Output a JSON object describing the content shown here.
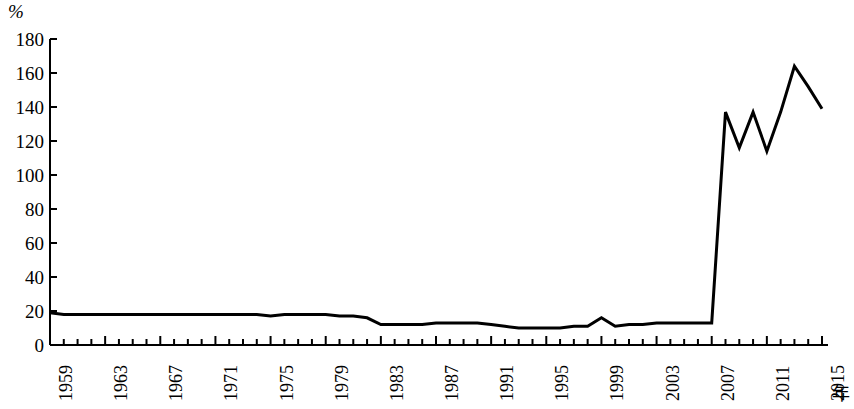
{
  "chart_data": {
    "type": "line",
    "title": "",
    "subtitle": "",
    "xlabel": "年",
    "ylabel": "%",
    "ylim": [
      0,
      180
    ],
    "xlim": [
      1959,
      2015
    ],
    "grid": false,
    "legend": null,
    "y_ticks": [
      0,
      20,
      40,
      60,
      80,
      100,
      120,
      140,
      160,
      180
    ],
    "y_tick_labels": [
      "0",
      "20",
      "40",
      "60",
      "80",
      "100",
      "120",
      "140",
      "160",
      "180"
    ],
    "x_tick_labels": [
      "1959",
      "1963",
      "1967",
      "1971",
      "1975",
      "1979",
      "1983",
      "1987",
      "1991",
      "1995",
      "1999",
      "2003",
      "2007",
      "2011",
      "2015"
    ],
    "x_tick_step": 4,
    "x_minor_tick_step": 1,
    "line_color": "#000000",
    "line_width": 3,
    "series": [
      {
        "name": "",
        "x": [
          1959,
          1960,
          1961,
          1962,
          1963,
          1964,
          1965,
          1966,
          1967,
          1968,
          1969,
          1970,
          1971,
          1972,
          1973,
          1974,
          1975,
          1976,
          1977,
          1978,
          1979,
          1980,
          1981,
          1982,
          1983,
          1984,
          1985,
          1986,
          1987,
          1988,
          1989,
          1990,
          1991,
          1992,
          1993,
          1994,
          1995,
          1996,
          1997,
          1998,
          1999,
          2000,
          2001,
          2002,
          2003,
          2004,
          2005,
          2006,
          2007,
          2008,
          2009,
          2010,
          2011,
          2012,
          2013,
          2014,
          2015
        ],
        "values": [
          19,
          18,
          18,
          18,
          18,
          18,
          18,
          18,
          18,
          18,
          18,
          18,
          18,
          18,
          18,
          18,
          17,
          18,
          18,
          18,
          18,
          17,
          17,
          16,
          12,
          12,
          12,
          12,
          13,
          13,
          13,
          13,
          12,
          11,
          10,
          10,
          10,
          10,
          11,
          11,
          16,
          11,
          12,
          12,
          13,
          13,
          13,
          13,
          13,
          137,
          116,
          137,
          114,
          137,
          164,
          152,
          139
        ]
      }
    ]
  },
  "axes": {
    "y_unit_label": "%",
    "x_unit_label": "年"
  }
}
